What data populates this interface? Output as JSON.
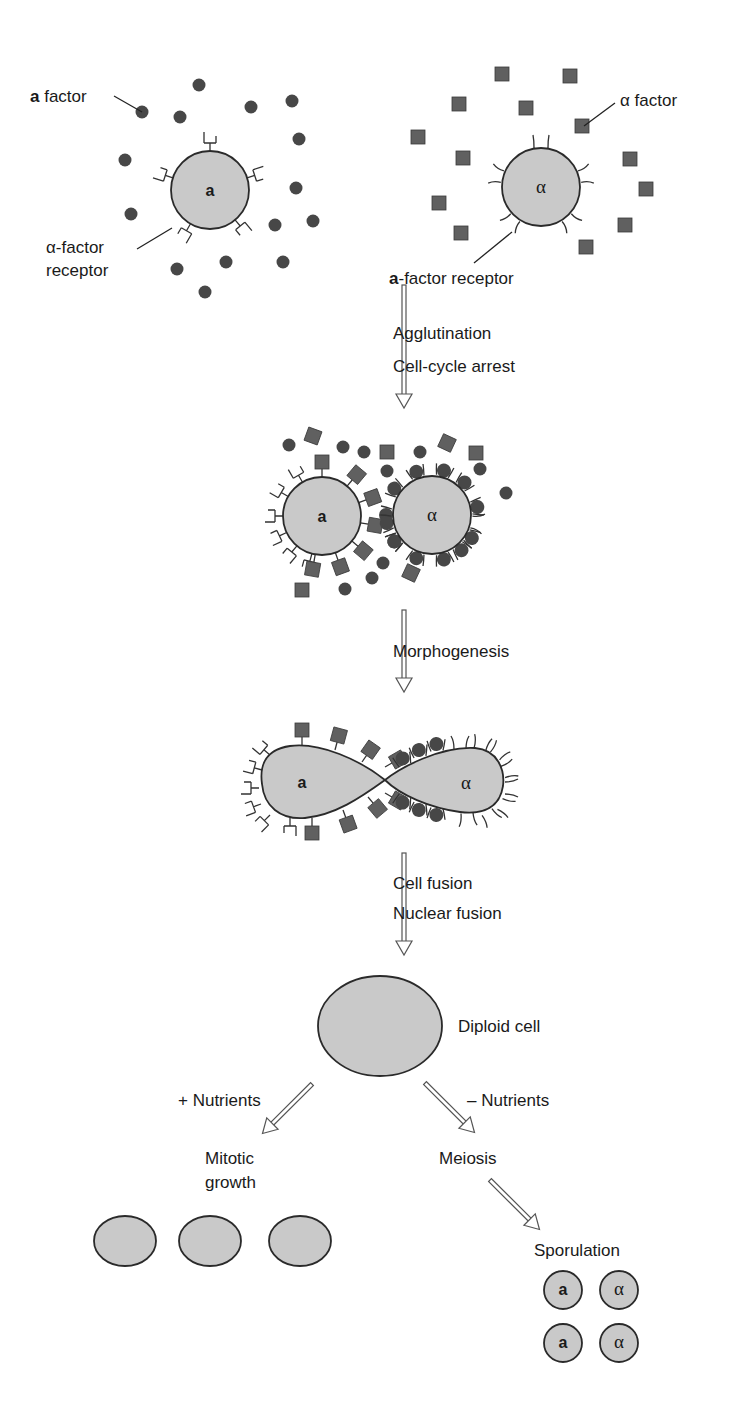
{
  "colors": {
    "cell_fill": "#c9c9c9",
    "cell_stroke": "#2a2a2a",
    "a_factor": "#474747",
    "alpha_factor": "#606060",
    "arrow_stroke": "#555555"
  },
  "stage1": {
    "a_cell": {
      "label": "a",
      "cx": 210,
      "cy": 190,
      "r": 39
    },
    "alpha_cell": {
      "label": "α",
      "cx": 541,
      "cy": 187,
      "r": 39
    },
    "labels": {
      "a_factor_bold": "a",
      "a_factor_rest": " factor",
      "alpha_factor": "α factor",
      "alpha_receptor_line1": "α-factor",
      "alpha_receptor_line2": "receptor",
      "a_receptor_bold": "a",
      "a_receptor_rest": "-factor receptor"
    },
    "a_factor_dots": [
      [
        199,
        85
      ],
      [
        142,
        112
      ],
      [
        180,
        117
      ],
      [
        251,
        107
      ],
      [
        292,
        101
      ],
      [
        299,
        139
      ],
      [
        125,
        160
      ],
      [
        296,
        188
      ],
      [
        131,
        214
      ],
      [
        275,
        225
      ],
      [
        313,
        221
      ],
      [
        177,
        269
      ],
      [
        226,
        262
      ],
      [
        283,
        262
      ],
      [
        205,
        292
      ]
    ],
    "alpha_factor_squares": [
      [
        502,
        74
      ],
      [
        570,
        76
      ],
      [
        459,
        104
      ],
      [
        526,
        108
      ],
      [
        582,
        126
      ],
      [
        418,
        137
      ],
      [
        463,
        158
      ],
      [
        630,
        159
      ],
      [
        439,
        203
      ],
      [
        646,
        189
      ],
      [
        461,
        233
      ],
      [
        625,
        225
      ],
      [
        586,
        247
      ]
    ]
  },
  "steps": [
    {
      "name": "agglutination",
      "lines": [
        "Agglutination",
        "Cell-cycle arrest"
      ],
      "x": 404,
      "y1": 285,
      "y2": 408,
      "text_x": 393,
      "text_y": [
        339,
        372
      ]
    },
    {
      "name": "morphogenesis",
      "lines": [
        "Morphogenesis"
      ],
      "x": 404,
      "y1": 610,
      "y2": 692,
      "text_x": 393,
      "text_y": [
        657
      ]
    },
    {
      "name": "fusion",
      "lines": [
        "Cell fusion",
        "Nuclear fusion"
      ],
      "x": 404,
      "y1": 853,
      "y2": 955,
      "text_x": 393,
      "text_y": [
        889,
        919
      ]
    }
  ],
  "stage2": {
    "a_cell": {
      "label": "a",
      "cx": 322,
      "cy": 516,
      "r": 39
    },
    "alpha_cell": {
      "label": "α",
      "cx": 432,
      "cy": 515,
      "r": 39
    },
    "free_dots": [
      [
        289,
        445
      ],
      [
        343,
        447
      ],
      [
        364,
        452
      ],
      [
        420,
        452
      ],
      [
        387,
        471
      ],
      [
        480,
        469
      ],
      [
        506,
        493
      ],
      [
        383,
        563
      ],
      [
        372,
        578
      ],
      [
        345,
        589
      ]
    ],
    "free_squares": [
      [
        313,
        436,
        20
      ],
      [
        387,
        452,
        0
      ],
      [
        447,
        443,
        25
      ],
      [
        476,
        453,
        0
      ],
      [
        302,
        590,
        0
      ],
      [
        411,
        573,
        25
      ]
    ]
  },
  "stage3": {
    "a_label": "a",
    "alpha_label": "α"
  },
  "stage4": {
    "diploid": {
      "cx": 380,
      "cy": 1026,
      "rx": 62,
      "ry": 50
    },
    "diploid_label": "Diploid cell",
    "plus_nutrients": "+ Nutrients",
    "minus_nutrients": "– Nutrients",
    "mitotic_line1": "Mitotic",
    "mitotic_line2": "growth",
    "meiosis": "Meiosis",
    "sporulation": "Sporulation",
    "mitotic_cells": [
      [
        125,
        1241
      ],
      [
        210,
        1241
      ],
      [
        300,
        1241
      ]
    ],
    "spores": [
      {
        "label": "a",
        "type": "a",
        "cx": 563,
        "cy": 1290
      },
      {
        "label": "α",
        "type": "alpha",
        "cx": 619,
        "cy": 1290
      },
      {
        "label": "a",
        "type": "a",
        "cx": 563,
        "cy": 1343
      },
      {
        "label": "α",
        "type": "alpha",
        "cx": 619,
        "cy": 1343
      }
    ]
  }
}
